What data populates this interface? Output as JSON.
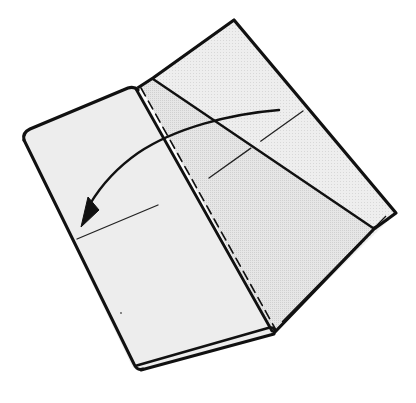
{
  "diagram": {
    "description": "Folded sheet of paper with a dashed valley-fold line; a curved arrow indicates folding the right flap over to the left",
    "colors": {
      "background": "#ffffff",
      "paper_fill": "#ececec",
      "paper_fill_shaded": "#e2e2e2",
      "line": "#111111"
    },
    "elements": {
      "left_panel": "left-paper-panel",
      "right_panel": "right-paper-panel",
      "fold_line": "dashed-valley-fold-line",
      "crease": "diagonal-crease-line",
      "arrow": "curved-fold-arrow",
      "guide_lines": [
        "reference-line-right",
        "reference-line-left"
      ]
    }
  }
}
